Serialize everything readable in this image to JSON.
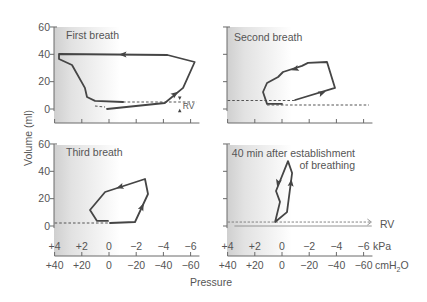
{
  "figure": {
    "y_axis_label": "Volume (ml)",
    "x_axis_label": "Pressure",
    "kpa_unit": "kPa",
    "cmh2o_unit": {
      "main": "cmH",
      "sub": "2",
      "tail": "O"
    },
    "rv_label": "RV"
  },
  "panels": [
    {
      "title_lines": [
        "First breath"
      ]
    },
    {
      "title_lines": [
        "Second breath"
      ]
    },
    {
      "title_lines": [
        "Third breath"
      ]
    },
    {
      "title_lines": [
        "40 min after establishment",
        "of breathing"
      ]
    }
  ],
  "chart_data": [
    {
      "type": "line",
      "title": "First breath",
      "xlabel": "Pressure",
      "ylabel": "Volume (ml)",
      "xunits": [
        "kPa",
        "cmH2O"
      ],
      "xlim_cmh2o": [
        40,
        -60
      ],
      "ylim": [
        0,
        60
      ],
      "y_ticks": [
        0,
        20,
        40,
        60
      ],
      "y_tick_labels": [
        "0",
        "20",
        "40",
        "60"
      ],
      "x_ticks_cmh2o": [
        40,
        20,
        0,
        -20,
        -40,
        -60
      ],
      "x_tick_labels_kpa": [
        "+4",
        "+2",
        "0",
        "−2",
        "−4",
        "−6"
      ],
      "x_tick_labels_cmh2o": [
        "+40",
        "+20",
        "0",
        "−20",
        "−40",
        "−60"
      ],
      "show_y_labels": true,
      "show_x_labels": false,
      "loop": {
        "closed": false,
        "points": [
          [
            1.5,
            0
          ],
          [
            -41,
            4.4
          ],
          [
            -54.5,
            15.4
          ],
          [
            -63,
            34.4
          ],
          [
            -43,
            39.5
          ],
          [
            36.8,
            40.2
          ],
          [
            36.8,
            36.6
          ],
          [
            27.2,
            32.2
          ],
          [
            17.7,
            15.4
          ],
          [
            16.2,
            8.8
          ],
          [
            10.3,
            5.9
          ],
          [
            -10.3,
            5.1
          ]
        ]
      },
      "dashed": [
        {
          "from": [
            10.3,
            2.2
          ],
          "to": [
            2.9,
            1.5
          ]
        },
        {
          "from": [
            -10.3,
            5.1
          ],
          "to": [
            -64.5,
            5.1
          ]
        }
      ],
      "reference": [],
      "arrows": [
        {
          "at": [
            -10.3,
            39.8
          ],
          "toward": [
            20,
            40
          ]
        },
        {
          "at": [
            -48.5,
            11
          ],
          "toward": [
            -54.5,
            15.4
          ]
        }
      ],
      "markers": [
        {
          "at": [
            -52,
            7.6
          ],
          "dir": "down"
        },
        {
          "at": [
            -52,
            -0.9
          ],
          "dir": "up"
        }
      ],
      "annotations": [
        {
          "text": "RV",
          "at": [
            -54.3,
            -0.2
          ],
          "size": 8.5
        }
      ]
    },
    {
      "type": "line",
      "title": "Second breath",
      "xlabel": "Pressure",
      "ylabel": "Volume (ml)",
      "xlim_cmh2o": [
        40,
        -60
      ],
      "ylim": [
        0,
        60
      ],
      "y_ticks": [
        0,
        20,
        40,
        60
      ],
      "y_tick_labels": [
        "0",
        "20",
        "40",
        "60"
      ],
      "x_ticks_cmh2o": [
        40,
        20,
        0,
        -20,
        -40,
        -60
      ],
      "x_tick_labels_kpa": [
        "+4",
        "+2",
        "0",
        "−2",
        "−4",
        "−6"
      ],
      "x_tick_labels_cmh2o": [
        "+40",
        "+20",
        "0",
        "−20",
        "−40",
        "−60"
      ],
      "show_y_labels": false,
      "show_x_labels": false,
      "loop": {
        "closed": false,
        "points": [
          [
            0,
            3.7
          ],
          [
            11,
            3.7
          ],
          [
            14,
            12.4
          ],
          [
            11,
            19
          ],
          [
            2.9,
            23.4
          ],
          [
            -0.7,
            27.1
          ],
          [
            -14.7,
            31.5
          ],
          [
            -19.1,
            33.7
          ],
          [
            -33.1,
            34.4
          ],
          [
            -39,
            15.4
          ],
          [
            -9.6,
            6.6
          ]
        ]
      },
      "dashed": [
        {
          "from": [
            40,
            6.2
          ],
          "to": [
            -9.6,
            6.2
          ]
        },
        {
          "from": [
            11,
            2.9
          ],
          "to": [
            -64,
            2.9
          ]
        }
      ],
      "reference": [],
      "arrows": [
        {
          "at": [
            -29.4,
            11.7
          ],
          "toward": [
            -39,
            15.4
          ]
        },
        {
          "at": [
            -9.6,
            29.3
          ],
          "toward": [
            2.9,
            25.2
          ]
        }
      ],
      "markers": [],
      "annotations": []
    },
    {
      "type": "line",
      "title": "Third breath",
      "xlabel": "Pressure",
      "ylabel": "Volume (ml)",
      "xlim_cmh2o": [
        40,
        -60
      ],
      "ylim": [
        0,
        60
      ],
      "y_ticks": [
        0,
        20,
        40,
        60
      ],
      "y_tick_labels": [
        "0",
        "20",
        "40",
        "60"
      ],
      "x_ticks_cmh2o": [
        40,
        20,
        0,
        -20,
        -40,
        -60
      ],
      "x_tick_labels_kpa": [
        "+4",
        "+2",
        "0",
        "−2",
        "−4",
        "−6"
      ],
      "x_tick_labels_cmh2o": [
        "+40",
        "+20",
        "0",
        "−20",
        "−40",
        "−60"
      ],
      "show_y_labels": true,
      "show_x_labels": true,
      "loop": {
        "closed": false,
        "points": [
          [
            -0.7,
            2.2
          ],
          [
            -19.1,
            2.9
          ],
          [
            -28.7,
            23.4
          ],
          [
            -26.5,
            34.4
          ],
          [
            2.9,
            24.9
          ],
          [
            14,
            11.7
          ],
          [
            8.8,
            3.7
          ],
          [
            0.7,
            3.7
          ]
        ]
      },
      "dashed": [
        {
          "from": [
            40,
            2.2
          ],
          "to": [
            0,
            2.2
          ]
        }
      ],
      "reference": [],
      "arrows": [
        {
          "at": [
            -24.3,
            13.9
          ],
          "toward": [
            -28.7,
            23.4
          ]
        },
        {
          "at": [
            -8.1,
            28.5
          ],
          "toward": [
            2.9,
            24.9
          ]
        }
      ],
      "markers": [],
      "annotations": []
    },
    {
      "type": "line",
      "title": "40 min after establishment of breathing",
      "xlabel": "Pressure",
      "ylabel": "Volume (ml)",
      "xlim_cmh2o": [
        40,
        -60
      ],
      "ylim": [
        0,
        60
      ],
      "y_ticks": [
        0,
        20,
        40,
        60
      ],
      "y_tick_labels": [
        "0",
        "20",
        "40",
        "60"
      ],
      "x_ticks_cmh2o": [
        40,
        20,
        0,
        -20,
        -40,
        -60
      ],
      "x_tick_labels_kpa": [
        "+4",
        "+2",
        "0",
        "−2",
        "−4",
        "−6"
      ],
      "x_tick_labels_cmh2o": [
        "+40",
        "+20",
        "0",
        "−20",
        "−40",
        "−60"
      ],
      "show_y_labels": false,
      "show_x_labels": true,
      "loop": {
        "closed": true,
        "points": [
          [
            5.1,
            2.9
          ],
          [
            -3.7,
            10.2
          ],
          [
            -7.4,
            38.8
          ],
          [
            -4.4,
            47.5
          ],
          [
            4.4,
            25.6
          ],
          [
            1.5,
            17.6
          ]
        ]
      },
      "dashed": [
        {
          "from": [
            40,
            2.9
          ],
          "to": [
            -65,
            2.9
          ],
          "open_arrow": true
        }
      ],
      "reference": [
        {
          "from": [
            35,
            0
          ],
          "to": [
            -66,
            0
          ]
        }
      ],
      "arrows": [
        {
          "at": [
            -6.6,
            31.5
          ],
          "toward": [
            -7.4,
            38.8
          ]
        },
        {
          "at": [
            2.9,
            31.5
          ],
          "toward": [
            4.4,
            25.6
          ]
        }
      ],
      "markers": [],
      "annotations": [
        {
          "text": "RV",
          "at": [
            -72,
            -1.6
          ],
          "size": 10.5
        }
      ]
    }
  ]
}
